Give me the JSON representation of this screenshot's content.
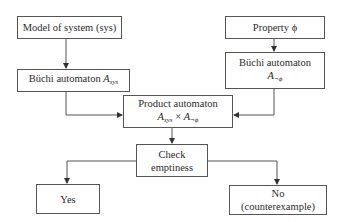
{
  "nodes": {
    "model": {
      "label": "Model of system (sys)"
    },
    "buchi_sys": {
      "label": "Büchi automaton ",
      "var": "A",
      "sub": "sys"
    },
    "property": {
      "label": "Property ϕ"
    },
    "buchi_neg": {
      "label": "Büchi automaton",
      "var": "A",
      "sub": "¬ϕ"
    },
    "product": {
      "label": "Product automaton",
      "var1": "A",
      "sub1": "sys",
      "times": " × ",
      "var2": "A",
      "sub2": "¬ϕ"
    },
    "check": {
      "line1": "Check",
      "line2": "emptiness"
    },
    "yes": {
      "label": "Yes"
    },
    "no": {
      "line1": "No",
      "line2": "(counterexample)"
    }
  },
  "edges": [
    {
      "from": "model",
      "to": "buchi_sys"
    },
    {
      "from": "property",
      "to": "buchi_neg"
    },
    {
      "from": "buchi_sys",
      "to": "product"
    },
    {
      "from": "buchi_neg",
      "to": "product"
    },
    {
      "from": "product",
      "to": "check"
    },
    {
      "from": "check",
      "to": "yes"
    },
    {
      "from": "check",
      "to": "no"
    }
  ],
  "colors": {
    "line": "#555555",
    "text": "#2a2a2a",
    "background": "#ffffff"
  }
}
